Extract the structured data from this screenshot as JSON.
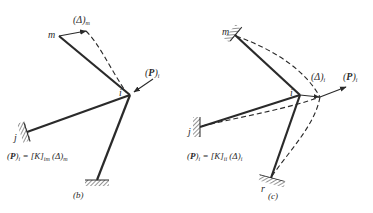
{
  "figure": {
    "panels": [
      {
        "id": "b",
        "caption": "(b)",
        "nodes": {
          "m": "m",
          "i": "i",
          "j": "j"
        },
        "labels": {
          "delta_m_main": "(Δ)",
          "delta_m_sub": "m",
          "p_i_open": "(",
          "p_i_main": "P",
          "p_i_close": ")",
          "p_i_sub": "i"
        },
        "formula": {
          "lhs_open": "(",
          "lhs_main": "P",
          "lhs_close": ")",
          "lhs_sub": "i",
          "eq": " = ",
          "k_main": "[K]",
          "k_sub": "im",
          "delta_main": " (Δ)",
          "delta_sub": "m"
        }
      },
      {
        "id": "c",
        "caption": "(c)",
        "nodes": {
          "m": "m",
          "i": "i",
          "j": "j",
          "r": "r"
        },
        "labels": {
          "delta_i_main": "(Δ)",
          "delta_i_sub": "i",
          "p_i_open": "(",
          "p_i_main": "P",
          "p_i_close": ")",
          "p_i_sub": "i"
        },
        "formula": {
          "lhs_open": "(",
          "lhs_main": "P",
          "lhs_close": ")",
          "lhs_sub": "i",
          "eq": " = ",
          "k_main": "[K]",
          "k_sub": "ii",
          "delta_main": " (Δ)",
          "delta_sub": "i"
        }
      }
    ],
    "colors": {
      "ink": "#2a2a2a",
      "background": "#ffffff"
    }
  }
}
